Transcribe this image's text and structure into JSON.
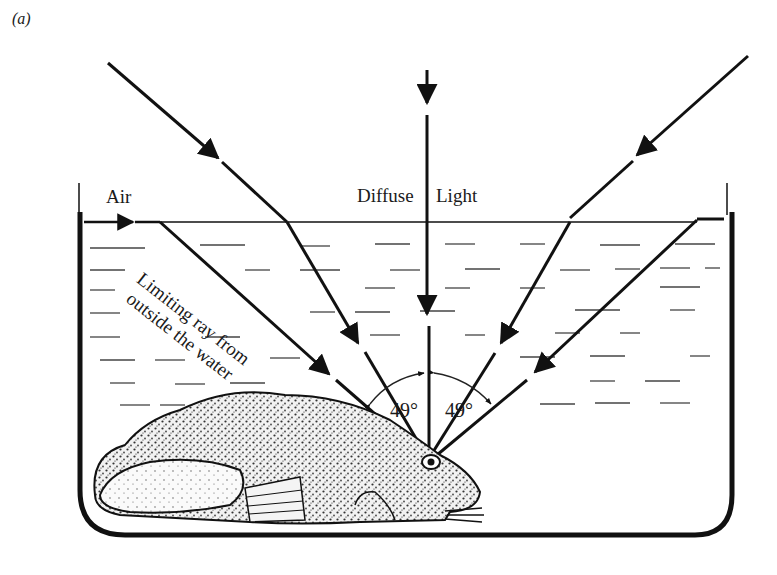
{
  "figure": {
    "panel_label": "(a)",
    "labels": {
      "air": "Air",
      "diffuse": "Diffuse",
      "light": "Light",
      "limiting_ray_line1": "Limiting ray from",
      "limiting_ray_line2": "outside the water",
      "angle_left": "49°",
      "angle_right": "49°"
    },
    "elements": [
      "tank",
      "water-surface",
      "light-rays",
      "refracted-rays",
      "frog",
      "frog-eye",
      "angle-arcs"
    ],
    "colors": {
      "ink": "#111111",
      "background": "#ffffff"
    }
  }
}
